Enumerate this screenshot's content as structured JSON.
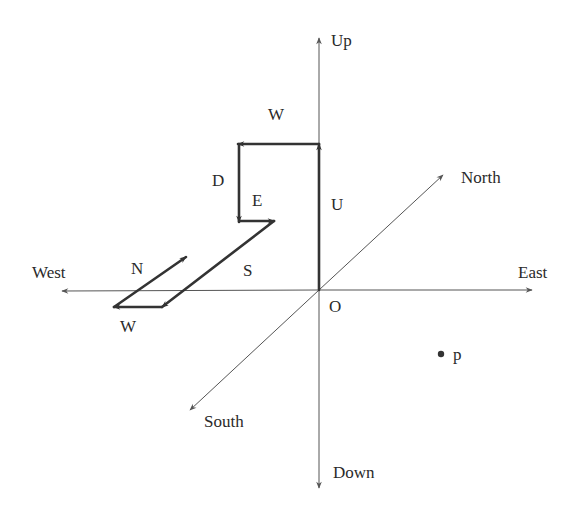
{
  "diagram": {
    "title": "",
    "origin": {
      "label": "O",
      "x": 319,
      "y": 290
    },
    "axes": [
      {
        "id": "up",
        "label": "Up",
        "tip": [
          319,
          38
        ],
        "label_pos": [
          331,
          46
        ]
      },
      {
        "id": "down",
        "label": "Down",
        "tip": [
          319,
          488
        ],
        "label_pos": [
          333,
          478
        ]
      },
      {
        "id": "east",
        "label": "East",
        "tip": [
          532,
          290
        ],
        "label_pos": [
          518,
          278
        ]
      },
      {
        "id": "west",
        "label": "West",
        "tip": [
          62,
          291
        ],
        "label_pos": [
          32,
          278
        ]
      },
      {
        "id": "north",
        "label": "North",
        "tip": [
          443,
          175
        ],
        "label_pos": [
          461,
          183
        ]
      },
      {
        "id": "south",
        "label": "South",
        "tip": [
          190,
          410
        ],
        "label_pos": [
          204,
          427
        ]
      }
    ],
    "path_segments": [
      {
        "label": "U",
        "from": [
          319,
          290
        ],
        "to": [
          319,
          144
        ],
        "label_pos": [
          331,
          210
        ]
      },
      {
        "label": "W",
        "from": [
          319,
          144
        ],
        "to": [
          238,
          144
        ],
        "label_pos": [
          268,
          120
        ]
      },
      {
        "label": "D",
        "from": [
          239,
          144
        ],
        "to": [
          239,
          222
        ],
        "label_pos": [
          212,
          186
        ]
      },
      {
        "label": "E",
        "from": [
          239,
          221
        ],
        "to": [
          274,
          221
        ],
        "label_pos": [
          252,
          206
        ]
      },
      {
        "label": "S",
        "from": [
          274,
          221
        ],
        "to": [
          162,
          307
        ],
        "label_pos": [
          243,
          276
        ]
      },
      {
        "label": "W",
        "from": [
          162,
          307
        ],
        "to": [
          114,
          307
        ],
        "label_pos": [
          120,
          332
        ]
      },
      {
        "label": "N",
        "from": [
          114,
          307
        ],
        "to": [
          186,
          257
        ],
        "label_pos": [
          131,
          274
        ]
      }
    ],
    "point": {
      "label": "p",
      "x": 441,
      "y": 354,
      "label_pos": [
        453,
        360
      ]
    },
    "colors": {
      "axis": "#555555",
      "path": "#333333",
      "text": "#2a2a2a"
    }
  }
}
